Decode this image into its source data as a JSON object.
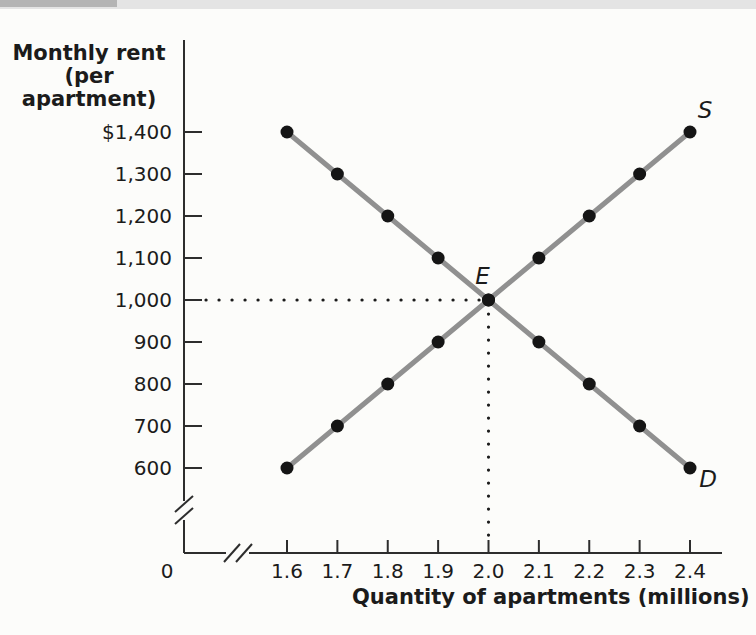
{
  "page": {
    "background": "#fcfcfa",
    "edge_strip_color": "#e4e4e4",
    "edge_strip_accent_color": "#b4b4b4"
  },
  "chart_data": {
    "type": "line",
    "title": "",
    "xlabel": "Quantity of apartments (millions)",
    "ylabel": "Monthly rent (per apartment)",
    "xlim": [
      1.6,
      2.4
    ],
    "ylim": [
      600,
      1400
    ],
    "grid": false,
    "legend_position": "curve-end-labels",
    "axis_color": "#2d2d2d",
    "text_color": "#1b1b1b",
    "guide_dot_color": "#1b1b1b",
    "y_axis": {
      "title_lines": [
        "Monthly rent",
        "(per apartment)"
      ],
      "has_break": true,
      "ticks": [
        {
          "value": 1400,
          "label": "$1,400"
        },
        {
          "value": 1300,
          "label": "1,300"
        },
        {
          "value": 1200,
          "label": "1,200"
        },
        {
          "value": 1100,
          "label": "1,100"
        },
        {
          "value": 1000,
          "label": "1,000"
        },
        {
          "value": 900,
          "label": "900"
        },
        {
          "value": 800,
          "label": "800"
        },
        {
          "value": 700,
          "label": "700"
        },
        {
          "value": 600,
          "label": "600"
        }
      ]
    },
    "x_axis": {
      "title": "Quantity of apartments (millions)",
      "has_break": true,
      "origin_label": "0",
      "ticks": [
        {
          "value": 1.6,
          "label": "1.6"
        },
        {
          "value": 1.7,
          "label": "1.7"
        },
        {
          "value": 1.8,
          "label": "1.8"
        },
        {
          "value": 1.9,
          "label": "1.9"
        },
        {
          "value": 2.0,
          "label": "2.0"
        },
        {
          "value": 2.1,
          "label": "2.1"
        },
        {
          "value": 2.2,
          "label": "2.2"
        },
        {
          "value": 2.3,
          "label": "2.3"
        },
        {
          "value": 2.4,
          "label": "2.4"
        }
      ]
    },
    "series": [
      {
        "name": "supply",
        "label": "S",
        "color": "#909090",
        "marker_color": "#151515",
        "points": [
          [
            1.6,
            600
          ],
          [
            1.7,
            700
          ],
          [
            1.8,
            800
          ],
          [
            1.9,
            900
          ],
          [
            2.0,
            1000
          ],
          [
            2.1,
            1100
          ],
          [
            2.2,
            1200
          ],
          [
            2.3,
            1300
          ],
          [
            2.4,
            1400
          ]
        ]
      },
      {
        "name": "demand",
        "label": "D",
        "color": "#909090",
        "marker_color": "#151515",
        "points": [
          [
            1.6,
            1400
          ],
          [
            1.7,
            1300
          ],
          [
            1.8,
            1200
          ],
          [
            1.9,
            1100
          ],
          [
            2.0,
            1000
          ],
          [
            2.1,
            900
          ],
          [
            2.2,
            800
          ],
          [
            2.3,
            700
          ],
          [
            2.4,
            600
          ]
        ]
      }
    ],
    "equilibrium": {
      "label": "E",
      "quantity": 2.0,
      "rent": 1000,
      "guides": [
        "horizontal-dotted-from-y-axis-at-1000",
        "vertical-dotted-to-x-axis-at-2.0"
      ]
    }
  }
}
